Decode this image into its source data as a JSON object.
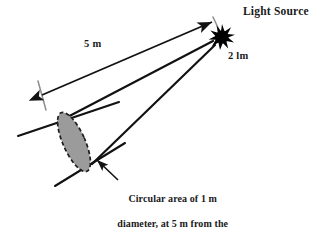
{
  "figure": {
    "type": "optics-illustration",
    "background_color": "#ffffff",
    "stroke_color": "#121212",
    "tick_color": "#8d8d8d",
    "area_fill_color": "#9b9b9b",
    "area_stroke_color": "#1c1c1c",
    "light_source_color": "#000000"
  },
  "labels": {
    "light_source": "Light Source",
    "luminous_flux": "2 lm",
    "distance": "5 m",
    "caption": "Circular area of 1 m diameter, at 5 m from the source"
  },
  "caption_lines": {
    "line1": "Circular area of 1 m",
    "line2": "diameter, at 5 m from the",
    "line3": "source"
  },
  "icons": {
    "light_source": "starburst-icon",
    "distance_arrow": "double-arrow-icon",
    "caption_pointer": "arrow-icon"
  },
  "geometry": {
    "light_source_center": {
      "x": 222,
      "y": 37
    },
    "light_source_radius": 12,
    "circular_area_center": {
      "x": 74,
      "y": 142
    },
    "circular_area_diameter_m": 1,
    "distance_m": 5,
    "luminous_flux_lm": 2
  }
}
